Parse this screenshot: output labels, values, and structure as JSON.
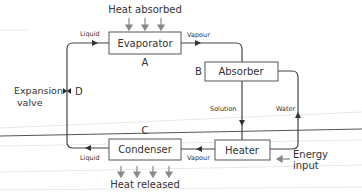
{
  "diagram": {
    "components": {
      "evaporator": {
        "label": "Evaporator",
        "letter": "A"
      },
      "absorber": {
        "label": "Absorber",
        "letter": "B"
      },
      "condenser": {
        "label": "Condenser",
        "letter": "C"
      },
      "heater": {
        "label": "Heater"
      },
      "expansion_valve": {
        "label_line1": "Expansion",
        "label_line2": "valve",
        "letter": "D"
      }
    },
    "flows": {
      "liquid_top": "Liquid",
      "vapour_top": "Vapour",
      "solution": "Solution",
      "water": "Water",
      "vapour_bottom": "Vapour",
      "liquid_bottom": "Liquid"
    },
    "annotations": {
      "heat_absorbed": "Heat absorbed",
      "heat_released": "Heat released",
      "energy_input_line1": "Energy",
      "energy_input_line2": "input"
    },
    "colors": {
      "line": "#444444",
      "arrow": "#888888",
      "faint": "#e6e6e6"
    }
  }
}
